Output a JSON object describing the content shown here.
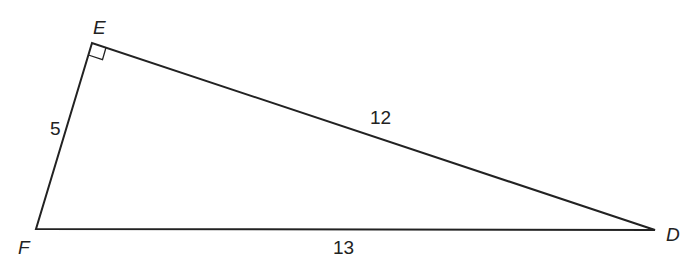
{
  "figure": {
    "type": "right-triangle",
    "stroke_color": "#222222",
    "background": "#ffffff",
    "vertices": [
      {
        "name": "E",
        "x": 92,
        "y": 43,
        "label_x": 93,
        "label_y": 34
      },
      {
        "name": "F",
        "x": 36,
        "y": 229,
        "label_x": 18,
        "label_y": 254
      },
      {
        "name": "D",
        "x": 655,
        "y": 230,
        "label_x": 666,
        "label_y": 241
      }
    ],
    "sides": [
      {
        "from": "F",
        "to": "E",
        "length_label": "5",
        "label_x": 50,
        "label_y": 135
      },
      {
        "from": "E",
        "to": "D",
        "length_label": "12",
        "label_x": 370,
        "label_y": 124
      },
      {
        "from": "F",
        "to": "D",
        "length_label": "13",
        "label_x": 333,
        "label_y": 254
      }
    ],
    "right_angle_at": "E"
  }
}
